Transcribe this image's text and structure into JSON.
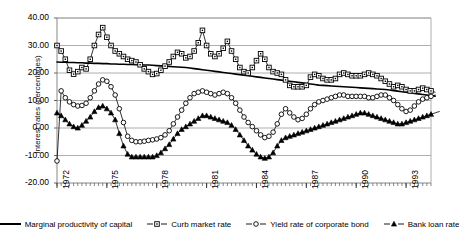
{
  "chart_data": {
    "type": "line",
    "title": "",
    "xlabel": "",
    "ylabel": "Interest rates (percentages)",
    "ylim": [
      -20,
      40
    ],
    "xlim": [
      1972,
      1994.5
    ],
    "yticks": [
      "40.00",
      "30.00",
      "20.00",
      "10.00",
      "0.00",
      "-10.00",
      "-20.00"
    ],
    "ytick_values": [
      40,
      30,
      20,
      10,
      0,
      -10,
      -20
    ],
    "xticks": [
      "1972",
      "1975",
      "1978",
      "1981",
      "1984",
      "1987",
      "1990",
      "1993"
    ],
    "xtick_values": [
      1972,
      1975,
      1978,
      1981,
      1984,
      1987,
      1990,
      1993
    ],
    "grid": true,
    "grid_axis": "y",
    "legend_position": "bottom",
    "x_start": 1972.0,
    "x_step": 0.25,
    "series": [
      {
        "name": "Marginal productivity of capital",
        "marker": "none",
        "color": "#000000",
        "values": [
          24.0,
          23.9,
          23.9,
          23.8,
          23.8,
          23.7,
          23.7,
          23.6,
          23.6,
          23.5,
          23.5,
          23.4,
          23.4,
          23.3,
          23.3,
          23.2,
          23.2,
          23.1,
          23.1,
          23.0,
          23.0,
          22.9,
          22.9,
          22.8,
          22.7,
          22.6,
          22.5,
          22.4,
          22.3,
          22.2,
          22.1,
          22.0,
          21.8,
          21.6,
          21.4,
          21.2,
          21.0,
          20.8,
          20.6,
          20.4,
          20.2,
          20.0,
          19.8,
          19.6,
          19.4,
          19.2,
          19.0,
          18.8,
          18.6,
          18.4,
          18.2,
          18.0,
          17.8,
          17.6,
          17.4,
          17.2,
          17.0,
          16.8,
          16.6,
          16.4,
          16.2,
          16.0,
          15.8,
          15.6,
          15.5,
          15.4,
          15.3,
          15.2,
          15.1,
          15.0,
          14.9,
          14.8,
          14.7,
          14.6,
          14.5,
          14.4,
          14.3,
          14.2,
          14.1,
          14.0,
          13.8,
          13.6,
          13.4,
          13.2,
          13.0,
          12.8,
          12.6,
          12.4,
          12.2,
          12.0,
          11.8,
          11.6
        ]
      },
      {
        "name": "Curb market rate",
        "marker": "square",
        "color": "#000000",
        "values": [
          30.0,
          28.0,
          25.0,
          21.0,
          19.6,
          20.5,
          22.0,
          21.5,
          25.0,
          30.0,
          34.0,
          36.5,
          33.0,
          30.0,
          28.0,
          27.0,
          26.0,
          25.0,
          24.5,
          24.0,
          23.0,
          21.5,
          20.5,
          19.5,
          19.8,
          21.0,
          22.5,
          24.0,
          26.0,
          27.5,
          27.0,
          25.5,
          26.0,
          28.0,
          31.0,
          35.5,
          30.0,
          27.0,
          26.0,
          27.0,
          29.0,
          31.5,
          28.0,
          25.0,
          22.0,
          20.5,
          20.0,
          22.0,
          24.5,
          27.0,
          25.0,
          22.0,
          20.5,
          20.0,
          19.5,
          17.5,
          15.5,
          15.0,
          15.0,
          15.0,
          15.5,
          18.5,
          19.5,
          19.0,
          18.0,
          17.5,
          17.5,
          18.0,
          19.5,
          20.0,
          19.5,
          19.0,
          19.0,
          19.0,
          19.5,
          20.0,
          19.5,
          19.0,
          18.0,
          17.0,
          16.0,
          15.0,
          15.5,
          15.0,
          14.0,
          13.5,
          13.5,
          14.0,
          14.5,
          14.0,
          13.5,
          13.0
        ]
      },
      {
        "name": "Yield rate of corporate bond",
        "marker": "circle",
        "color": "#000000",
        "values": [
          -12.0,
          13.5,
          11.0,
          9.5,
          8.5,
          8.0,
          8.2,
          9.0,
          11.0,
          13.5,
          16.0,
          17.5,
          17.0,
          15.0,
          12.0,
          7.0,
          2.0,
          -3.0,
          -4.5,
          -5.0,
          -5.0,
          -4.8,
          -4.5,
          -4.3,
          -4.0,
          -3.5,
          -2.5,
          -1.0,
          1.5,
          4.0,
          6.5,
          9.0,
          11.0,
          12.5,
          13.0,
          13.5,
          13.0,
          12.5,
          12.0,
          12.5,
          13.0,
          12.5,
          11.0,
          9.0,
          6.5,
          4.0,
          2.0,
          0.5,
          -1.0,
          -2.5,
          -3.5,
          -3.0,
          -1.5,
          1.5,
          5.0,
          7.0,
          5.5,
          4.0,
          3.0,
          3.5,
          5.0,
          7.0,
          8.5,
          9.5,
          10.0,
          10.5,
          11.0,
          11.5,
          12.0,
          12.0,
          11.5,
          11.5,
          11.5,
          11.5,
          11.5,
          11.0,
          11.0,
          11.5,
          12.0,
          12.0,
          11.0,
          10.0,
          8.5,
          7.0,
          6.0,
          6.5,
          8.0,
          9.5,
          10.5,
          11.0,
          11.5,
          12.0
        ]
      },
      {
        "name": "Bank loan rate",
        "marker": "triangle",
        "color": "#000000",
        "values": [
          5.5,
          4.5,
          3.0,
          1.5,
          0.5,
          0.0,
          1.0,
          2.5,
          4.0,
          6.0,
          7.5,
          8.0,
          7.0,
          5.5,
          3.0,
          -2.0,
          -6.5,
          -9.5,
          -10.5,
          -10.5,
          -10.5,
          -10.5,
          -10.5,
          -10.5,
          -10.0,
          -9.0,
          -7.5,
          -6.0,
          -4.0,
          -2.0,
          -0.5,
          0.5,
          1.5,
          2.5,
          3.5,
          4.5,
          4.5,
          4.0,
          3.5,
          3.0,
          2.5,
          2.0,
          1.0,
          -0.5,
          -2.5,
          -4.5,
          -6.5,
          -8.0,
          -9.5,
          -10.5,
          -11.0,
          -10.5,
          -9.0,
          -6.5,
          -4.5,
          -3.5,
          -3.0,
          -2.5,
          -2.0,
          -1.5,
          -1.0,
          -0.5,
          0.0,
          0.5,
          1.0,
          1.5,
          2.0,
          2.5,
          3.0,
          3.5,
          4.0,
          4.5,
          5.0,
          5.5,
          5.5,
          5.0,
          4.5,
          4.0,
          3.5,
          3.0,
          2.5,
          2.0,
          1.5,
          1.5,
          2.0,
          2.5,
          3.0,
          3.5,
          4.0,
          4.5,
          5.0,
          5.5,
          6.0
        ]
      }
    ]
  },
  "legend": {
    "items": [
      {
        "label": "Marginal productivity of capital",
        "marker": "line"
      },
      {
        "label": "Curb market rate",
        "marker": "square"
      },
      {
        "label": "Yield rate of corporate bond",
        "marker": "circle"
      },
      {
        "label": "Bank loan rate",
        "marker": "triangle"
      }
    ]
  }
}
